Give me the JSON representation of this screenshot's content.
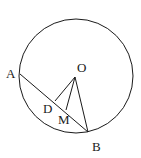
{
  "diagram": {
    "type": "geometry-circle",
    "circle": {
      "center": "O",
      "cx": 76,
      "cy": 76,
      "r": 57
    },
    "points": {
      "O": {
        "x": 75,
        "y": 77,
        "label": "O",
        "lx": 77,
        "ly": 72
      },
      "A": {
        "x": 20,
        "y": 74,
        "label": "A",
        "lx": 6,
        "ly": 78
      },
      "B": {
        "x": 88,
        "y": 132,
        "label": "B",
        "lx": 92,
        "ly": 151
      },
      "D": {
        "x": 55,
        "y": 101,
        "label": "D",
        "lx": 43,
        "ly": 113
      },
      "M": {
        "x": 66,
        "y": 110,
        "label": "M",
        "lx": 58,
        "ly": 124
      }
    },
    "segments": [
      {
        "from": "A",
        "to": "B"
      },
      {
        "from": "O",
        "to": "D"
      },
      {
        "from": "O",
        "to": "M"
      },
      {
        "from": "O",
        "to": "B"
      }
    ],
    "stroke_color": "#1a1a1a"
  }
}
